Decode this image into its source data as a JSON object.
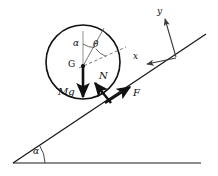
{
  "figure": {
    "background": "#ffffff",
    "stroke": "#1a1a1a",
    "dashed_stroke": "#555555",
    "axis_stroke": "#3a3a3a"
  },
  "labels": {
    "center_point": "G",
    "weight": "Mg",
    "normal": "N",
    "friction": "F",
    "axis_x": "x",
    "axis_y": "y",
    "angle_alpha_top": "α",
    "angle_theta": "θ",
    "angle_alpha_base": "α"
  },
  "geometry": {
    "incline": {
      "x1": 13,
      "y1": 163,
      "x2": 206,
      "y2": 34,
      "angle_deg": 33.7
    },
    "ground": {
      "x1": 13,
      "y1": 163,
      "x2": 201,
      "y2": 163
    },
    "circle": {
      "cx": 83,
      "cy": 62,
      "r": 37
    },
    "contact_point": {
      "x": 110,
      "y": 100
    },
    "vectors": [
      {
        "name": "weight",
        "label": "Mg",
        "from": [
          83,
          66
        ],
        "to": [
          83,
          101
        ]
      },
      {
        "name": "normal",
        "label": "N",
        "from": [
          110,
          102
        ],
        "to": [
          93,
          81
        ]
      },
      {
        "name": "friction",
        "label": "F",
        "from": [
          107,
          100
        ],
        "to": [
          132,
          86
        ]
      },
      {
        "name": "axis-y",
        "label": "y",
        "from": [
          176,
          57
        ],
        "to": [
          164,
          17
        ]
      },
      {
        "name": "axis-x",
        "label": "x",
        "from": [
          176,
          58
        ],
        "to": [
          146,
          64
        ]
      }
    ],
    "angle_lines": {
      "vertical_up": {
        "from": [
          83,
          66
        ],
        "to": [
          83,
          34
        ]
      },
      "radius_solid": {
        "from": [
          83,
          66
        ],
        "to": [
          104,
          31
        ]
      },
      "radius_dashed": {
        "from": [
          83,
          66
        ],
        "to": [
          124,
          48
        ]
      }
    }
  },
  "label_positions": {
    "G": {
      "left": 68,
      "top": 61
    },
    "Mg": {
      "left": 60,
      "top": 88
    },
    "N": {
      "left": 99,
      "top": 72
    },
    "F": {
      "left": 133,
      "top": 89
    },
    "x": {
      "left": 134,
      "top": 53
    },
    "y": {
      "left": 157,
      "top": 8
    },
    "alpha_top": {
      "left": 74,
      "top": 40
    },
    "theta": {
      "left": 93,
      "top": 42
    },
    "alpha_base": {
      "left": 33,
      "top": 148
    }
  }
}
